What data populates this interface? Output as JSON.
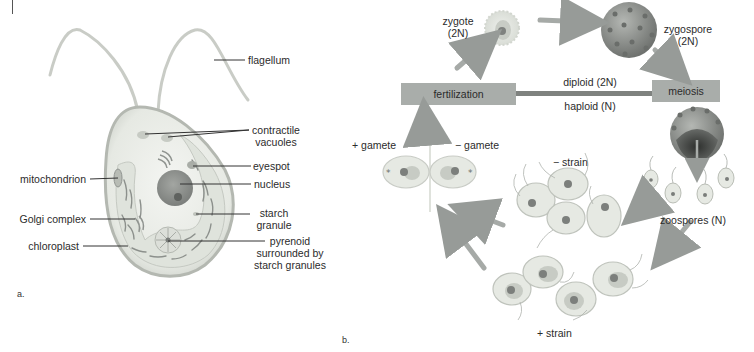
{
  "figure": {
    "panel_a": {
      "letter": "a.",
      "labels": {
        "flagellum": "flagellum",
        "contractile_vacuoles_1": "contractile",
        "contractile_vacuoles_2": "vacuoles",
        "eyespot": "eyespot",
        "nucleus": "nucleus",
        "starch_granule_1": "starch",
        "starch_granule_2": "granule",
        "pyrenoid_1": "pyrenoid",
        "pyrenoid_2": "surrounded by",
        "pyrenoid_3": "starch granules",
        "mitochondrion": "mitochondrion",
        "golgi_complex": "Golgi complex",
        "chloroplast": "chloroplast"
      }
    },
    "panel_b": {
      "letter": "b.",
      "stages": {
        "zygote_1": "zygote",
        "zygote_2": "(2N)",
        "zygospore_1": "zygospore",
        "zygospore_2": "(2N)",
        "fertilization": "fertilization",
        "meiosis": "meiosis",
        "diploid": "diploid (2N)",
        "haploid": "haploid (N)",
        "plus_gamete": "+  gamete",
        "minus_gamete": "−  gamete",
        "minus_strain": "−  strain",
        "plus_strain": "+  strain",
        "zoospores": "zoospores (N)"
      }
    },
    "colors": {
      "cell_fill": "#e9ece6",
      "cell_outline": "#b9bdb5",
      "bar_fill": "#a9adaa",
      "bar_line": "#7f827f",
      "arrow": "#9a9e9b",
      "nucleus": "#8f928f",
      "zygospore": "#8c8f8c"
    }
  }
}
